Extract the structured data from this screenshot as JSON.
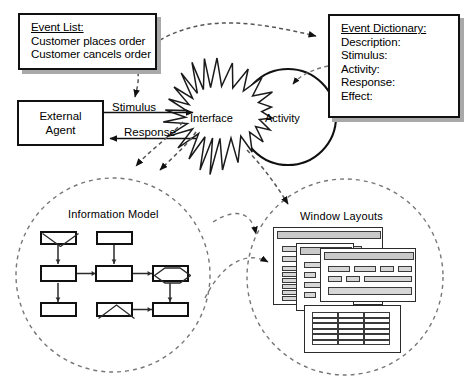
{
  "diagram": {
    "title_hidden": "",
    "accent": "#000000",
    "shadow_color": "#a9a9a9",
    "fill": "#ffffff",
    "ui_gray": "#c9c9c9",
    "field_gray": "#d6d6d6"
  },
  "event_list": {
    "header": "Event List:",
    "items": [
      "Customer places order",
      "Customer cancels order"
    ]
  },
  "event_dictionary": {
    "header": "Event Dictionary:",
    "items": [
      "Description:",
      "Stimulus:",
      "Activity:",
      "Response:",
      "Effect:"
    ]
  },
  "external_agent": {
    "lines": [
      "External",
      "Agent"
    ]
  },
  "flows": {
    "stimulus_label": "Stimulus",
    "response_label": "Response"
  },
  "interface": {
    "label": "Interface",
    "shape": "starburst-icon"
  },
  "activity": {
    "label": "Activity",
    "shape": "circle-icon"
  },
  "information_model": {
    "label": "Information Model",
    "entities": [
      {
        "name": "entity-top-left",
        "adornment": "supertype-triangle"
      },
      {
        "name": "entity-top-mid",
        "adornment": "none"
      },
      {
        "name": "entity-mid-left",
        "adornment": "none"
      },
      {
        "name": "entity-mid-center",
        "adornment": "none"
      },
      {
        "name": "entity-mid-right",
        "adornment": "associative-diamond"
      },
      {
        "name": "entity-bottom-left",
        "adornment": "none"
      },
      {
        "name": "entity-bottom-mid",
        "adornment": "supertype-triangle"
      },
      {
        "name": "entity-bottom-right",
        "adornment": "none"
      }
    ]
  },
  "window_layouts": {
    "label": "Window Layouts",
    "windows": [
      {
        "name": "window-back",
        "title_bar": true
      },
      {
        "name": "window-middle",
        "title_bar": true
      },
      {
        "name": "window-front",
        "title_bar": false,
        "grid_columns": 3,
        "grid_rows": 6
      }
    ]
  }
}
